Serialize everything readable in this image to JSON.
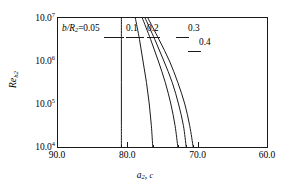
{
  "chart_data": {
    "type": "line",
    "title": "",
    "subtitle": "",
    "xlabel": "a2, c",
    "ylabel": "Reb2",
    "xlabel_parts": {
      "symbol": "a",
      "sub": "2",
      "tail": ", c"
    },
    "ylabel_parts": {
      "symbol": "Re",
      "sub": "b2"
    },
    "xlim": [
      90.0,
      60.0
    ],
    "ylim": [
      10000,
      10000000
    ],
    "yscale": "log",
    "xscale": "linear",
    "x_reversed": true,
    "grid": false,
    "legend": "inline-curve-labels",
    "xticks": [
      "90.0",
      "80.0",
      "70.0",
      "60.0"
    ],
    "xtick_values": [
      90.0,
      80.0,
      70.0,
      60.0
    ],
    "yticks": [
      "10.0",
      "10.0",
      "10.0",
      "10.0"
    ],
    "ytick_exponents": [
      "7",
      "6",
      "5",
      "4"
    ],
    "ytick_values": [
      10000000,
      1000000,
      100000,
      10000
    ],
    "series": [
      {
        "name": "b/R2=0.05",
        "label_text": "b/R",
        "label_sub": "2",
        "label_tail": "=0.05",
        "points": [
          {
            "y": 10000,
            "x": 80.9
          },
          {
            "y": 31623,
            "x": 80.9
          },
          {
            "y": 100000,
            "x": 80.9
          },
          {
            "y": 316228,
            "x": 80.9
          },
          {
            "y": 1000000,
            "x": 80.9
          },
          {
            "y": 3162278,
            "x": 80.9
          },
          {
            "y": 10000000,
            "x": 80.9
          }
        ]
      },
      {
        "name": "0.1",
        "label_text": "0.1",
        "points": [
          {
            "y": 10000,
            "x": 76.4
          },
          {
            "y": 31623,
            "x": 76.6
          },
          {
            "y": 100000,
            "x": 76.9
          },
          {
            "y": 316228,
            "x": 77.3
          },
          {
            "y": 1000000,
            "x": 77.8
          },
          {
            "y": 3162278,
            "x": 78.3
          },
          {
            "y": 10000000,
            "x": 78.9
          }
        ]
      },
      {
        "name": "0.2",
        "label_text": "0.2",
        "points": [
          {
            "y": 10000,
            "x": 72.8
          },
          {
            "y": 31623,
            "x": 73.2
          },
          {
            "y": 100000,
            "x": 73.8
          },
          {
            "y": 316228,
            "x": 74.6
          },
          {
            "y": 1000000,
            "x": 75.6
          },
          {
            "y": 3162278,
            "x": 76.7
          },
          {
            "y": 10000000,
            "x": 77.9
          }
        ]
      },
      {
        "name": "0.3",
        "label_text": "0.3",
        "points": [
          {
            "y": 10000,
            "x": 71.6
          },
          {
            "y": 31623,
            "x": 72.0
          },
          {
            "y": 100000,
            "x": 72.7
          },
          {
            "y": 316228,
            "x": 73.6
          },
          {
            "y": 1000000,
            "x": 74.8
          },
          {
            "y": 3162278,
            "x": 76.1
          },
          {
            "y": 10000000,
            "x": 77.5
          }
        ]
      },
      {
        "name": "0.4",
        "label_text": "0.4",
        "points": [
          {
            "y": 10000,
            "x": 70.6
          },
          {
            "y": 31623,
            "x": 71.1
          },
          {
            "y": 100000,
            "x": 71.8
          },
          {
            "y": 316228,
            "x": 72.8
          },
          {
            "y": 1000000,
            "x": 74.0
          },
          {
            "y": 3162278,
            "x": 75.5
          },
          {
            "y": 10000000,
            "x": 77.1
          }
        ]
      }
    ],
    "annotations": [
      {
        "text": "b/R2=0.05",
        "x_px": 62,
        "y_px": 24
      },
      {
        "text": "0.1",
        "x_px": 126,
        "y_px": 24
      },
      {
        "text": "0.2",
        "x_px": 147,
        "y_px": 24
      },
      {
        "text": "0.3",
        "x_px": 188,
        "y_px": 24
      },
      {
        "text": "0.4",
        "x_px": 199,
        "y_px": 38
      }
    ]
  },
  "axes": {
    "y": {
      "title_symbol": "Re",
      "title_sub": "b2",
      "ticks": [
        {
          "mantissa": "10.0",
          "exp": "7"
        },
        {
          "mantissa": "10.0",
          "exp": "6"
        },
        {
          "mantissa": "10.0",
          "exp": "5"
        },
        {
          "mantissa": "10.0",
          "exp": "4"
        }
      ]
    },
    "x": {
      "title_symbol": "a",
      "title_sub": "2",
      "title_tail": ", ",
      "title_c": "c",
      "ticks": [
        "90.0",
        "80.0",
        "70.0",
        "60.0"
      ]
    }
  },
  "labels": {
    "curve1_head": "b/R",
    "curve1_sub": "2",
    "curve1_tail": "=0.05",
    "curve2": "0.1",
    "curve3": "0.2",
    "curve4": "0.3",
    "curve5": "0.4"
  },
  "colors": {
    "axis": "#1a1a1a",
    "curve": "#1a1a1a",
    "background": "#ffffff"
  }
}
